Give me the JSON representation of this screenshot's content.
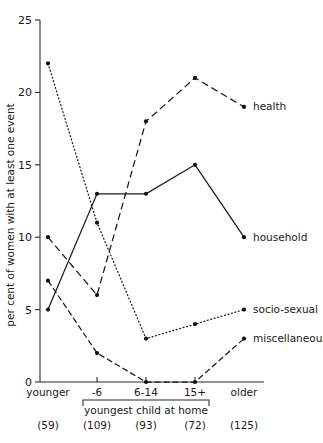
{
  "chart_data": {
    "type": "line",
    "title": "",
    "subtitle": "",
    "xlabel": "youngest child at home",
    "ylabel": "per cent of women with at least one event",
    "categories": [
      "younger",
      "-6",
      "6-14",
      "15+",
      "older"
    ],
    "group_counts": [
      "(59)",
      "(109)",
      "(93)",
      "(72)",
      "(125)"
    ],
    "xlim": [
      0,
      4
    ],
    "ylim": [
      0,
      25
    ],
    "yticks": [
      0,
      5,
      10,
      15,
      20,
      25
    ],
    "ytick_labels": [
      "0",
      "5",
      "10",
      "15",
      "20",
      "25"
    ],
    "grid": false,
    "legend_position": "right-inline",
    "bracket_groups": [
      "-6",
      "6-14",
      "15+"
    ],
    "series": [
      {
        "name": "health",
        "label": "health",
        "style": "dashed",
        "values": [
          10,
          6,
          18,
          21,
          19
        ]
      },
      {
        "name": "household",
        "label": "household",
        "style": "solid",
        "values": [
          5,
          13,
          13,
          15,
          10
        ]
      },
      {
        "name": "socio-sexual",
        "label": "socio-sexual",
        "style": "dotted",
        "values": [
          22,
          11,
          3,
          4,
          5
        ]
      },
      {
        "name": "miscellaneous",
        "label": "miscellaneous",
        "style": "dash-dot",
        "values": [
          7,
          2,
          0,
          0,
          3
        ]
      }
    ]
  }
}
